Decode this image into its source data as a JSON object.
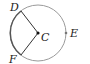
{
  "diagram": {
    "type": "circle-sector",
    "center": {
      "label": "C"
    },
    "points": [
      {
        "label": "D",
        "position": "upper-left on circle"
      },
      {
        "label": "E",
        "position": "right on circle"
      },
      {
        "label": "F",
        "position": "lower-left on circle"
      }
    ],
    "segments": [
      "CD",
      "CF"
    ],
    "highlighted_arc": "DF",
    "colors": {
      "circle": "#9a9a9a",
      "arc_highlight": "#555555",
      "radii": "#333333",
      "text": "#222222"
    }
  }
}
